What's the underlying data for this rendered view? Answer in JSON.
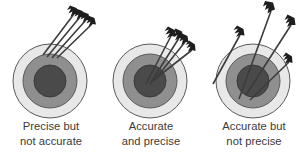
{
  "figure": {
    "background_color": "#ffffff",
    "width": 307,
    "height": 163
  },
  "colors": {
    "ring_outer_fill": "#e8e8e8",
    "ring_middle_fill": "#8f8f8f",
    "ring_inner_fill": "#4a4a4a",
    "ring_stroke": "#5a5a5a",
    "arrow_shaft": "#3c3c3c",
    "arrow_fletching": "#1e1e1e",
    "caption_text": "#3a3a3a"
  },
  "panels": [
    {
      "id": "precise-not-accurate",
      "caption_line_1": "Precise but",
      "caption_line_2": "not accurate",
      "target": {
        "center_x": 50,
        "center_y": 81,
        "radius_outer": 37,
        "radius_middle": 27,
        "radius_inner": 16
      },
      "arrows": [
        {
          "tip_x": 43,
          "tip_y": 55,
          "tail_x": 74,
          "tail_y": 14
        },
        {
          "tip_x": 47,
          "tip_y": 57,
          "tail_x": 80,
          "tail_y": 17
        },
        {
          "tip_x": 52,
          "tip_y": 58,
          "tail_x": 86,
          "tail_y": 20
        },
        {
          "tip_x": 57,
          "tip_y": 58,
          "tail_x": 92,
          "tail_y": 24
        }
      ]
    },
    {
      "id": "accurate-and-precise",
      "caption_line_1": "Accurate",
      "caption_line_2": "and precise",
      "target": {
        "center_x": 50,
        "center_y": 81,
        "radius_outer": 37,
        "radius_middle": 27,
        "radius_inner": 16
      },
      "arrows": [
        {
          "tip_x": 46,
          "tip_y": 84,
          "tail_x": 71,
          "tail_y": 36
        },
        {
          "tip_x": 50,
          "tip_y": 84,
          "tail_x": 79,
          "tail_y": 38
        },
        {
          "tip_x": 53,
          "tip_y": 82,
          "tail_x": 85,
          "tail_y": 42
        },
        {
          "tip_x": 55,
          "tip_y": 79,
          "tail_x": 92,
          "tail_y": 50
        }
      ]
    },
    {
      "id": "accurate-not-precise",
      "caption_line_1": "Accurate but",
      "caption_line_2": "not precise",
      "target": {
        "center_x": 50,
        "center_y": 81,
        "radius_outer": 37,
        "radius_middle": 27,
        "radius_inner": 16
      },
      "arrows": [
        {
          "tip_x": 10,
          "tip_y": 84,
          "tail_x": 37,
          "tail_y": 35
        },
        {
          "tip_x": 36,
          "tip_y": 99,
          "tail_x": 68,
          "tail_y": 11
        },
        {
          "tip_x": 43,
          "tip_y": 95,
          "tail_x": 88,
          "tail_y": 25
        },
        {
          "tip_x": 47,
          "tip_y": 100,
          "tail_x": 86,
          "tail_y": 62
        }
      ]
    }
  ]
}
